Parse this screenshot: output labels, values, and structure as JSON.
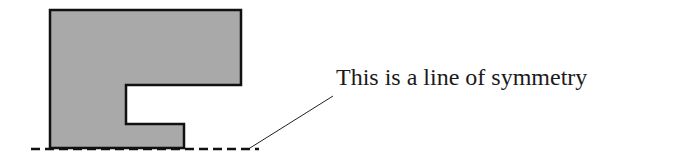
{
  "annotation": {
    "label": "This is a line of symmetry"
  },
  "colors": {
    "shape_fill": "#a9a9a9",
    "stroke": "#111111"
  },
  "shape": {
    "name": "half-shape with notch",
    "points": [
      [
        50,
        10
      ],
      [
        241,
        10
      ],
      [
        241,
        85
      ],
      [
        126,
        85
      ],
      [
        126,
        124
      ],
      [
        184,
        124
      ],
      [
        184,
        148
      ],
      [
        50,
        148
      ]
    ]
  }
}
